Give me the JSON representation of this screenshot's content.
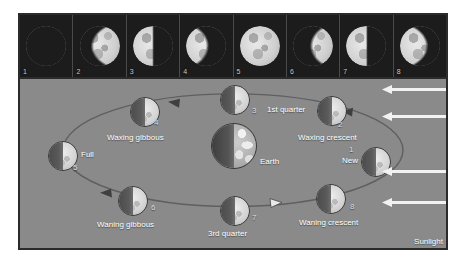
{
  "figure": {
    "background_color": "#8a8a8a",
    "frame_color": "#2b2b2b"
  },
  "filmstrip": {
    "background_color": "#1c1c1c",
    "cells": [
      {
        "number": "1",
        "phase": "new",
        "illumination": 0.0
      },
      {
        "number": "2",
        "phase": "waxing crescent",
        "illumination": 0.22
      },
      {
        "number": "3",
        "phase": "first quarter",
        "illumination": 0.5
      },
      {
        "number": "4",
        "phase": "waxing gibbous",
        "illumination": 0.78
      },
      {
        "number": "5",
        "phase": "full",
        "illumination": 1.0
      },
      {
        "number": "6",
        "phase": "waning gibbous",
        "illumination": 0.78
      },
      {
        "number": "7",
        "phase": "last quarter",
        "illumination": 0.5
      },
      {
        "number": "8",
        "phase": "waning crescent",
        "illumination": 0.18
      }
    ]
  },
  "diagram": {
    "center_body": {
      "label": "Earth"
    },
    "orbit_direction": "counterclockwise",
    "moons": [
      {
        "number": "1",
        "label": "New",
        "x": 341,
        "y": 83
      },
      {
        "number": "2",
        "label": "Waxing crescent",
        "x": 297,
        "y": 27
      },
      {
        "number": "3",
        "label": "1st quarter",
        "x": 200,
        "y": 16
      },
      {
        "number": "4",
        "label": "Waxing gibbous",
        "x": 110,
        "y": 28
      },
      {
        "number": "5",
        "label": "Full",
        "x": 28,
        "y": 77
      },
      {
        "number": "6",
        "label": "Waning gibbous",
        "x": 98,
        "y": 118
      },
      {
        "number": "7",
        "label": "3rd quarter",
        "x": 200,
        "y": 127
      },
      {
        "number": "8",
        "label": "Waning crescent",
        "x": 296,
        "y": 116
      }
    ]
  },
  "sunlight": {
    "label": "Sunlight",
    "arrow_color": "#f2f2f2",
    "arrow_count": 4,
    "direction": "left"
  }
}
